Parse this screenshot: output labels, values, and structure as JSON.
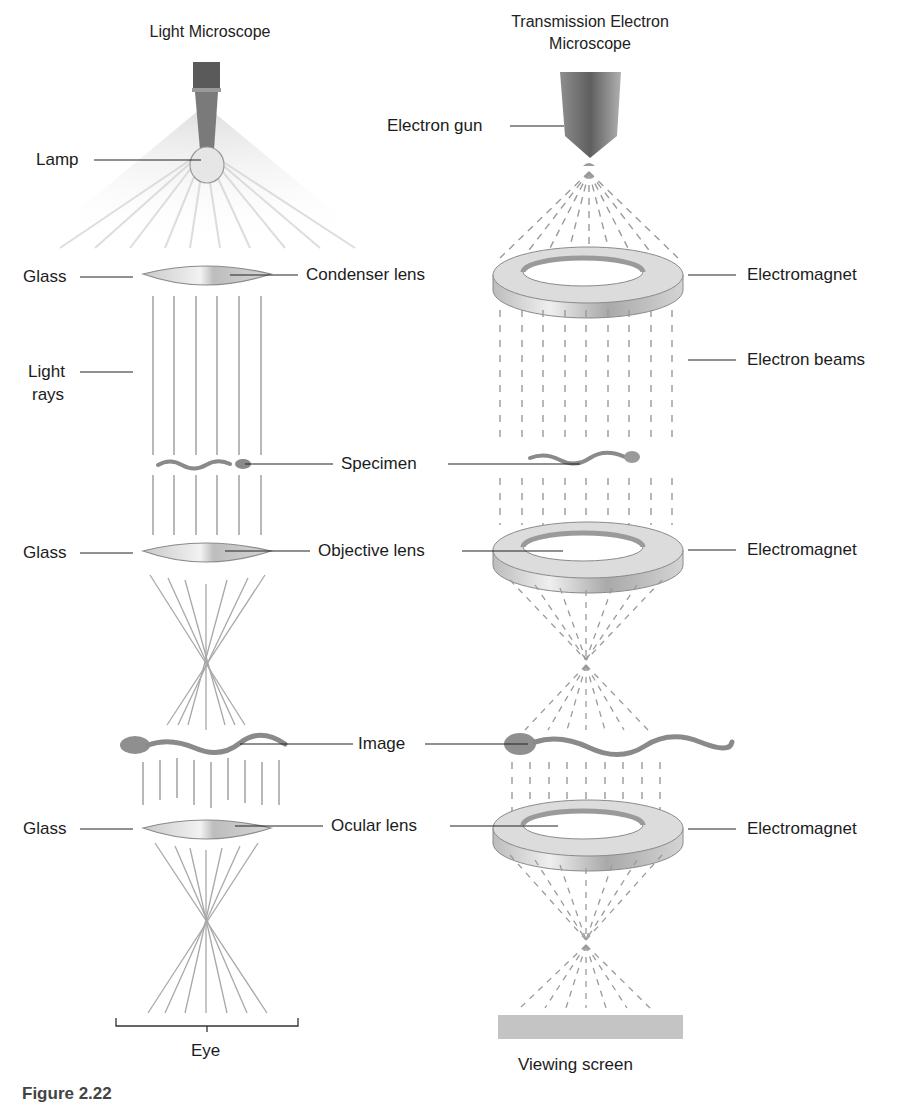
{
  "diagram": {
    "type": "comparison-schematic",
    "left_title": "Light Microscope",
    "right_title_line1": "Transmission Electron",
    "right_title_line2": "Microscope",
    "left_labels": {
      "lamp": "Lamp",
      "glass_1": "Glass",
      "light_rays_line1": "Light",
      "light_rays_line2": "rays",
      "glass_2": "Glass",
      "glass_3": "Glass",
      "eye": "Eye"
    },
    "center_labels": {
      "condenser": "Condenser lens",
      "specimen": "Specimen",
      "objective": "Objective lens",
      "image": "Image",
      "ocular": "Ocular lens"
    },
    "right_labels": {
      "electron_gun": "Electron gun",
      "electromagnet_1": "Electromagnet",
      "electron_beams": "Electron beams",
      "electromagnet_2": "Electromagnet",
      "electromagnet_3": "Electromagnet",
      "viewing_screen": "Viewing screen"
    },
    "caption": "Figure 2.22"
  },
  "colors": {
    "ray": "#9a9a9a",
    "lens_fill": "#d8d8d8",
    "ring_fill": "#cfcfcf",
    "specimen": "#8a8a8a",
    "screen": "#c4c4c4",
    "leader": "#222222"
  }
}
